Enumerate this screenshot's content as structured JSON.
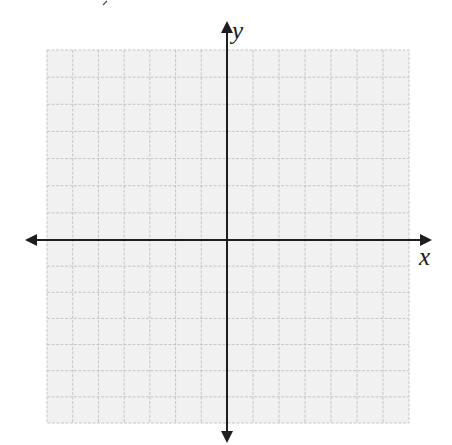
{
  "diagram": {
    "type": "coordinate-plane",
    "grid": {
      "columns": 14,
      "rows": 14,
      "left": 47,
      "top": 50,
      "right": 409,
      "bottom": 423,
      "fill_color": "#f1f1f1",
      "line_color": "#c6c6c6"
    },
    "axes": {
      "origin": {
        "x": 227,
        "y": 240
      },
      "color": "#1e1e1e",
      "x_axis": {
        "from": 25,
        "to": 432,
        "label": "x"
      },
      "y_axis": {
        "from": 21,
        "to": 443,
        "label": "y"
      }
    }
  }
}
